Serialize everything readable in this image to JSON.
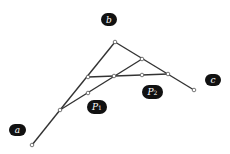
{
  "diagram": {
    "labels": {
      "a": "a",
      "b": "b",
      "c": "c",
      "p1": "P",
      "p1_sub": "1",
      "p2": "P",
      "p2_sub": "2"
    },
    "colors": {
      "line": "#333333",
      "label_bg": "#111111",
      "label_text": "#ffffff"
    },
    "points": {
      "apex": [
        115,
        42
      ],
      "a_end": [
        32,
        145
      ],
      "c_end": [
        194,
        90
      ],
      "right_mid": [
        142,
        59
      ],
      "h_right": [
        168,
        74
      ],
      "h_left": [
        88,
        77
      ],
      "h_mid": [
        114,
        76
      ],
      "h_mid2": [
        142,
        75
      ],
      "low": [
        60,
        110
      ],
      "low2": [
        88,
        93
      ]
    }
  }
}
